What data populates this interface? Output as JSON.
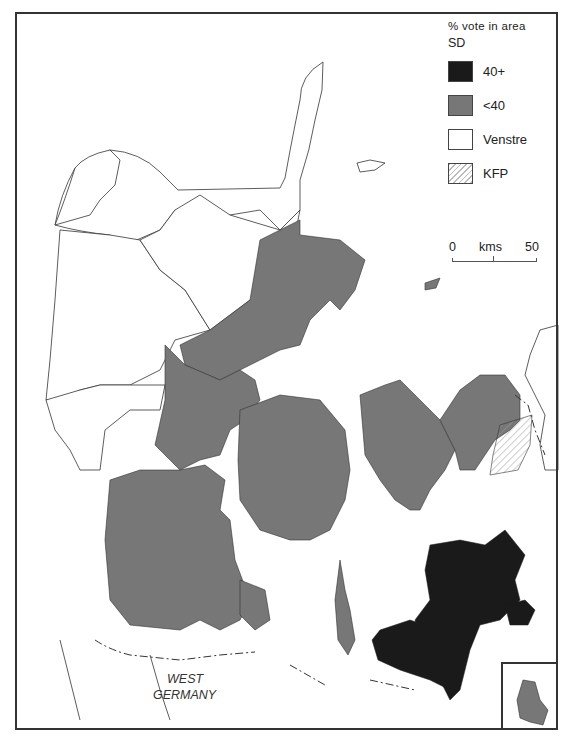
{
  "legend": {
    "title": "% vote in area",
    "party": "SD",
    "items": [
      {
        "label": "40+",
        "color": "#1a1a1a"
      },
      {
        "label": "<40",
        "color": "#777777"
      },
      {
        "label": "Venstre",
        "color": "#ffffff"
      },
      {
        "label": "KFP",
        "color": "hatched"
      }
    ]
  },
  "scale": {
    "start": "0",
    "unit": "kms",
    "end": "50"
  },
  "labels": {
    "country_line1": "WEST",
    "country_line2": "GERMANY"
  },
  "colors": {
    "sd_high": "#1a1a1a",
    "sd_low": "#777777",
    "venstre": "#ffffff",
    "outline": "#333333"
  }
}
